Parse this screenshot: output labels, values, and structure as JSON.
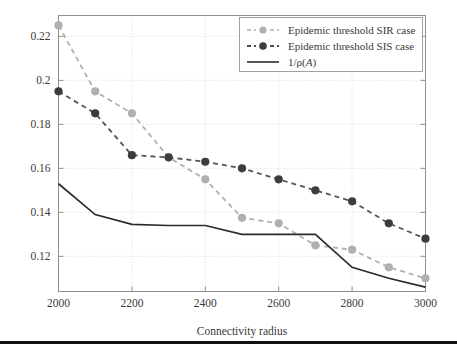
{
  "chart_data": {
    "type": "line",
    "title": "",
    "xlabel": "Connectivity radius",
    "ylabel": "",
    "xlim": [
      2000,
      3000
    ],
    "ylim": [
      0.104,
      0.2295
    ],
    "grid": true,
    "legend_position": "top-right",
    "x": [
      2000,
      2100,
      2200,
      2300,
      2400,
      2500,
      2600,
      2700,
      2800,
      2900,
      3000
    ],
    "xticks": [
      2000,
      2200,
      2400,
      2600,
      2800,
      3000
    ],
    "xtick_labels": [
      "2000",
      "2200",
      "2400",
      "2600",
      "2800",
      "3000"
    ],
    "yticks": [
      0.12,
      0.14,
      0.16,
      0.18,
      0.2,
      0.22
    ],
    "ytick_labels": [
      "0.12",
      "0.14",
      "0.16",
      "0.18",
      "0.2",
      "0.22"
    ],
    "series": [
      {
        "name": "Epidemic threshold SIR case",
        "color": "#b0b0b0",
        "style": "dashed",
        "marker": "circle",
        "values": [
          0.225,
          0.195,
          0.185,
          0.165,
          0.155,
          0.1375,
          0.135,
          0.125,
          0.123,
          0.115,
          0.11
        ]
      },
      {
        "name": "Epidemic threshold SIS case",
        "color": "#555555",
        "style": "dashed",
        "marker": "circle",
        "values": [
          0.195,
          0.185,
          0.166,
          0.165,
          0.163,
          0.16,
          0.155,
          0.15,
          0.145,
          0.135,
          0.128
        ]
      },
      {
        "name": "1/ρ(A)",
        "color": "#2b2b2b",
        "style": "solid",
        "marker": "none",
        "values": [
          0.153,
          0.139,
          0.1345,
          0.134,
          0.134,
          0.13,
          0.13,
          0.13,
          0.115,
          0.11,
          0.106
        ]
      }
    ]
  },
  "axis": {
    "xlabel": "Connectivity radius",
    "xtick_0": "2000",
    "xtick_1": "2200",
    "xtick_2": "2400",
    "xtick_3": "2600",
    "xtick_4": "2800",
    "xtick_5": "3000",
    "ytick_0": "0.12",
    "ytick_1": "0.14",
    "ytick_2": "0.16",
    "ytick_3": "0.18",
    "ytick_4": "0.2",
    "ytick_5": "0.22"
  },
  "legend": {
    "entry_0": "Epidemic threshold SIR case",
    "entry_1": "Epidemic threshold SIS case",
    "entry_2_prefix": "1/",
    "entry_2_rho": "ρ",
    "entry_2_open": "(",
    "entry_2_var": "A",
    "entry_2_close": ")"
  }
}
